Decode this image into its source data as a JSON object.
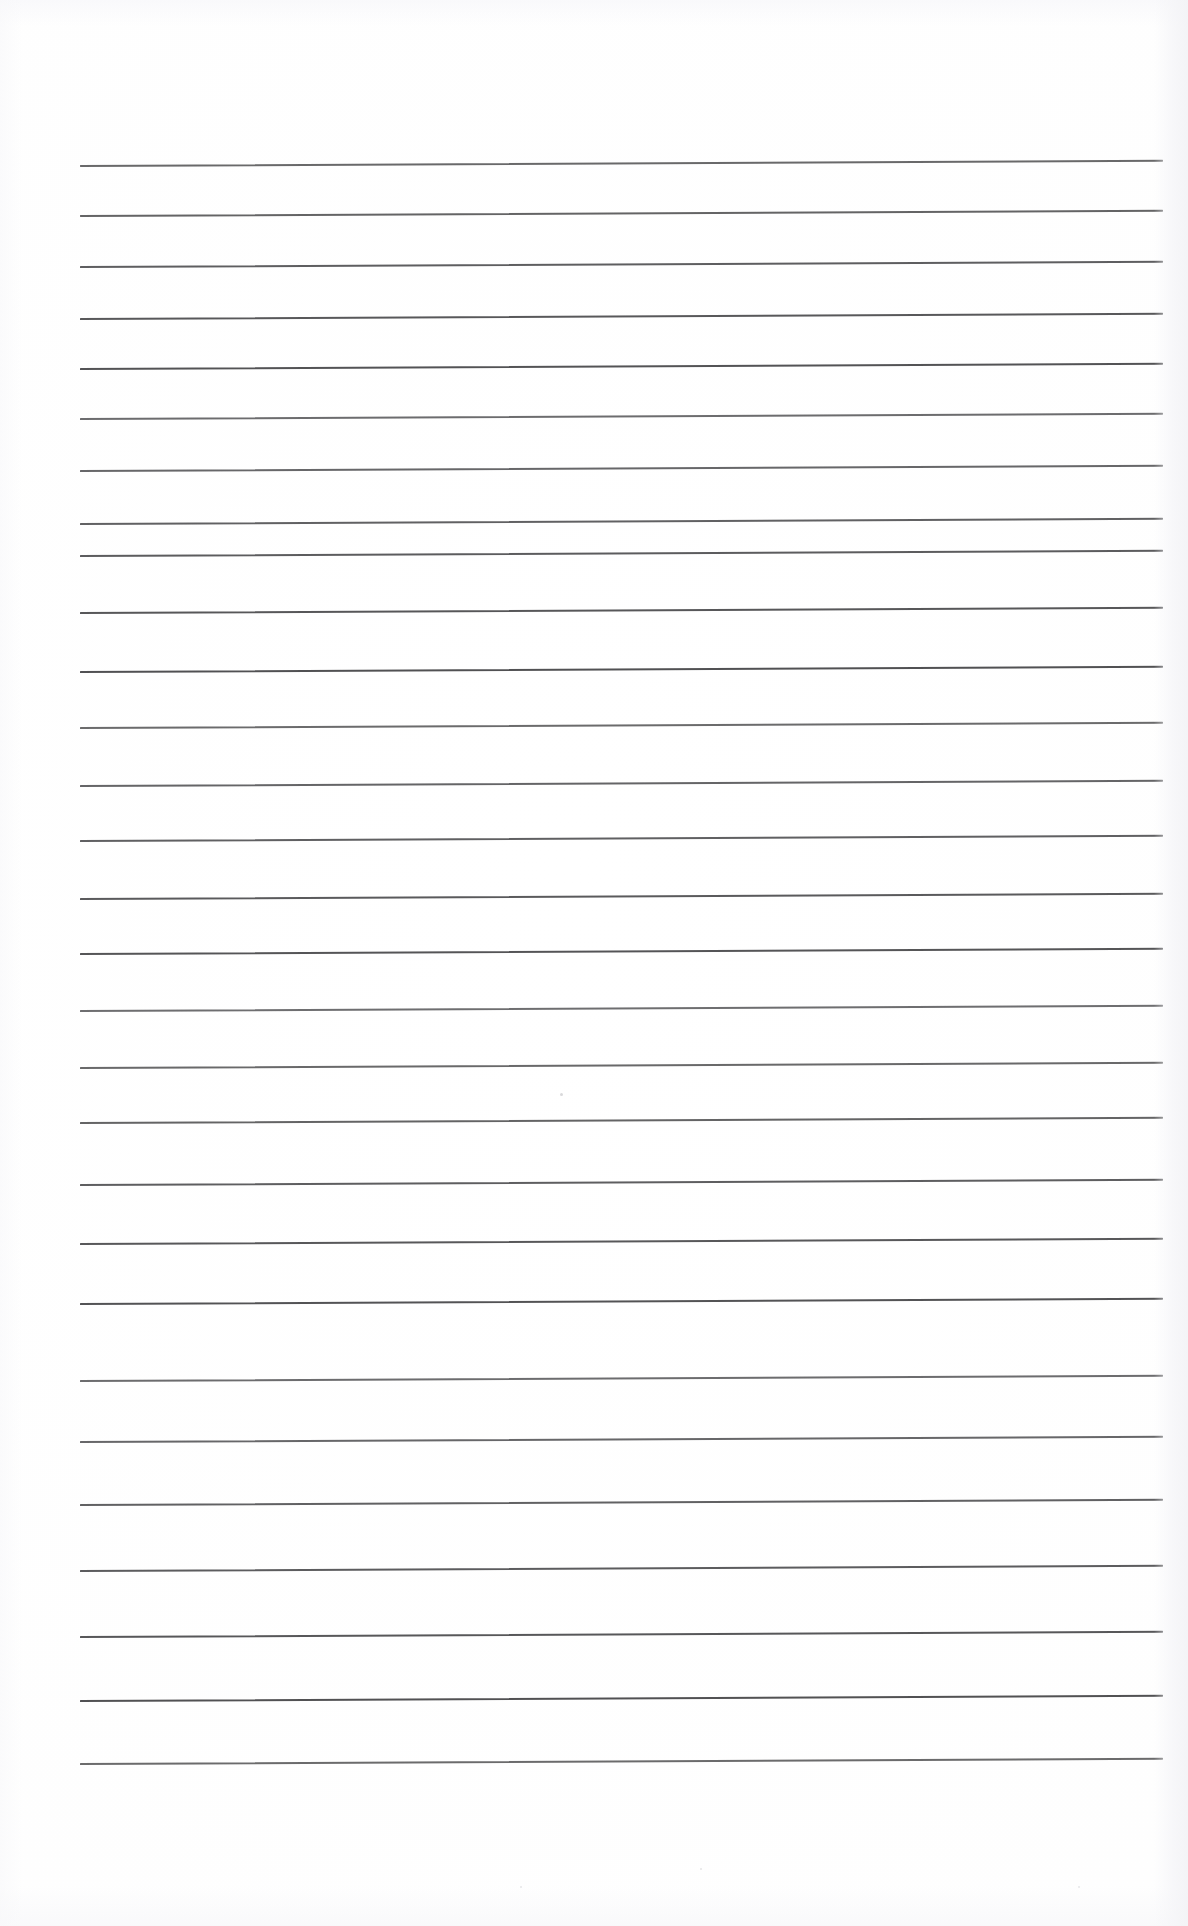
{
  "document": {
    "kind": "scanned-lined-paper",
    "title": "Blank ruled notebook page",
    "page_width": 1188,
    "page_height": 1926,
    "background_color": "#ffffff",
    "paper_tint": "#fdfdfe",
    "content_text": "",
    "handwriting_present": "no",
    "printed_text_present": "no"
  },
  "ruling": {
    "line_color": "#4a4a4c",
    "line_thickness_px": 2,
    "line_count": 27,
    "left_margin_px": 80,
    "right_margin_px": 1163,
    "line_length_px": 1083,
    "skew_degrees": -0.28,
    "first_line_y": 165,
    "last_line_y": 1763,
    "top_margin_px": 165,
    "bottom_margin_px": 163,
    "spacing_top_px": 51,
    "spacing_bottom_px": 63,
    "lines": [
      {
        "index": 1,
        "y": 165,
        "x_start": 80,
        "x_end": 1163
      },
      {
        "index": 2,
        "y": 215,
        "x_start": 80,
        "x_end": 1163
      },
      {
        "index": 3,
        "y": 266,
        "x_start": 80,
        "x_end": 1163
      },
      {
        "index": 4,
        "y": 318,
        "x_start": 80,
        "x_end": 1163
      },
      {
        "index": 5,
        "y": 368,
        "x_start": 80,
        "x_end": 1163
      },
      {
        "index": 6,
        "y": 418,
        "x_start": 80,
        "x_end": 1163
      },
      {
        "index": 7,
        "y": 470,
        "x_start": 80,
        "x_end": 1163
      },
      {
        "index": 8,
        "y": 523,
        "x_start": 80,
        "x_end": 1163
      },
      {
        "index": 9,
        "y": 555,
        "x_start": 80,
        "x_end": 1163
      },
      {
        "index": 10,
        "y": 612,
        "x_start": 80,
        "x_end": 1163
      },
      {
        "index": 11,
        "y": 671,
        "x_start": 80,
        "x_end": 1163
      },
      {
        "index": 12,
        "y": 727,
        "x_start": 80,
        "x_end": 1163
      },
      {
        "index": 13,
        "y": 785,
        "x_start": 80,
        "x_end": 1163
      },
      {
        "index": 14,
        "y": 840,
        "x_start": 80,
        "x_end": 1163
      },
      {
        "index": 15,
        "y": 898,
        "x_start": 80,
        "x_end": 1163
      },
      {
        "index": 16,
        "y": 953,
        "x_start": 80,
        "x_end": 1163
      },
      {
        "index": 17,
        "y": 1010,
        "x_start": 80,
        "x_end": 1163
      },
      {
        "index": 18,
        "y": 1067,
        "x_start": 80,
        "x_end": 1163
      },
      {
        "index": 19,
        "y": 1122,
        "x_start": 80,
        "x_end": 1163
      },
      {
        "index": 20,
        "y": 1184,
        "x_start": 80,
        "x_end": 1163
      },
      {
        "index": 21,
        "y": 1243,
        "x_start": 80,
        "x_end": 1163
      },
      {
        "index": 22,
        "y": 1303,
        "x_start": 80,
        "x_end": 1163
      },
      {
        "index": 23,
        "y": 1380,
        "x_start": 80,
        "x_end": 1163
      },
      {
        "index": 24,
        "y": 1441,
        "x_start": 80,
        "x_end": 1163
      },
      {
        "index": 25,
        "y": 1504,
        "x_start": 80,
        "x_end": 1163
      },
      {
        "index": 26,
        "y": 1570,
        "x_start": 80,
        "x_end": 1163
      },
      {
        "index": 27,
        "y": 1636,
        "x_start": 80,
        "x_end": 1163
      },
      {
        "index": 28,
        "y": 1700,
        "x_start": 80,
        "x_end": 1163
      },
      {
        "index": 29,
        "y": 1763,
        "x_start": 80,
        "x_end": 1163
      }
    ]
  },
  "artifacts": {
    "specks": [
      {
        "x": 560,
        "y": 1093,
        "size": 3,
        "color": "#d9d9db"
      },
      {
        "x": 700,
        "y": 1868,
        "size": 2,
        "color": "#e4e4e6"
      },
      {
        "x": 520,
        "y": 1886,
        "size": 2,
        "color": "#e6e6e8"
      },
      {
        "x": 1078,
        "y": 1886,
        "size": 2,
        "color": "#e6e6e8"
      }
    ]
  }
}
